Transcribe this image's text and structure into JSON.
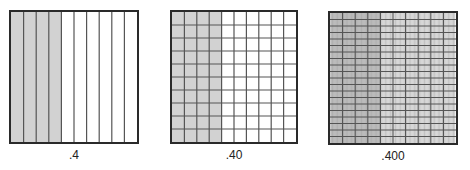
{
  "colors": {
    "shade": "#d2d2d2",
    "line": "#555555",
    "border": "#2a2a2a",
    "fine_line": "#9a9a9a"
  },
  "figures": [
    {
      "label": ".4",
      "columns": 10,
      "rows": 1,
      "sub_columns": 1,
      "shaded_columns": 4,
      "x": 9,
      "y": 10,
      "w": 130,
      "h": 134
    },
    {
      "label": ".40",
      "columns": 10,
      "rows": 10,
      "sub_columns": 1,
      "shaded_columns": 4,
      "x": 170,
      "y": 10,
      "w": 128,
      "h": 134
    },
    {
      "label": ".400",
      "columns": 10,
      "rows": 20,
      "sub_columns": 10,
      "shaded_columns": 4,
      "x": 328,
      "y": 11,
      "w": 130,
      "h": 134
    }
  ]
}
